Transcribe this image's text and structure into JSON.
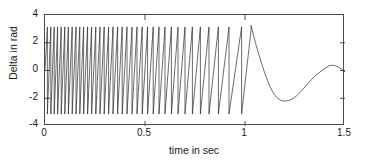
{
  "chart_data": {
    "type": "line",
    "title": "",
    "xlabel": "time in sec",
    "ylabel": "Delta in rad",
    "xlim": [
      0,
      1.5
    ],
    "ylim": [
      -4,
      4
    ],
    "xticks": [
      0,
      0.5,
      1,
      1.5
    ],
    "xtick_labels": [
      "0",
      "0.5",
      "1",
      "1.5"
    ],
    "yticks": [
      -4,
      -2,
      0,
      2,
      4
    ],
    "ytick_labels": [
      "-4",
      "-2",
      "0",
      "2",
      "4"
    ],
    "grid": false,
    "legend": null,
    "line_color": "#2b2b2b",
    "axis_color": "#4a4a4a",
    "background": "#ffffff",
    "wrap_limit": 3.14,
    "series": [
      {
        "name": "Delta",
        "comment": "Wrapped phase angle; sampled envelope and wrap instants read off the plot.",
        "wrap_times": [
          0.012,
          0.029,
          0.046,
          0.063,
          0.081,
          0.099,
          0.117,
          0.136,
          0.155,
          0.174,
          0.193,
          0.213,
          0.233,
          0.254,
          0.275,
          0.296,
          0.318,
          0.34,
          0.363,
          0.386,
          0.41,
          0.435,
          0.46,
          0.486,
          0.513,
          0.541,
          0.57,
          0.6,
          0.632,
          0.665,
          0.7,
          0.737,
          0.777,
          0.82,
          0.867,
          0.92,
          0.983,
          1.032
        ],
        "tail_x": [
          1.032,
          1.06,
          1.09,
          1.12,
          1.15,
          1.18,
          1.2,
          1.23,
          1.26,
          1.29,
          1.32,
          1.35,
          1.38,
          1.41,
          1.43,
          1.46,
          1.5
        ],
        "tail_y": [
          3.14,
          1.6,
          0.2,
          -1.0,
          -1.8,
          -2.15,
          -2.2,
          -2.1,
          -1.8,
          -1.35,
          -0.85,
          -0.4,
          -0.05,
          0.25,
          0.37,
          0.3,
          -0.1
        ]
      }
    ]
  },
  "axes": {
    "ytick_labels": [
      "4",
      "2",
      "0",
      "-2",
      "-4"
    ],
    "xtick_labels": [
      "0",
      "0.5",
      "1",
      "1.5"
    ],
    "xlabel": "time in sec",
    "ylabel": "Delta in rad"
  }
}
